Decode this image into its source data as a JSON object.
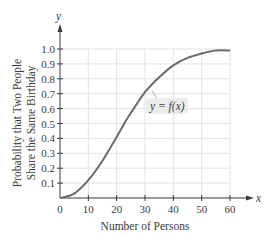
{
  "chart_data": {
    "type": "line",
    "title": "",
    "xlabel": "Number of Persons",
    "ylabel_line1": "Probability that Two People",
    "ylabel_line2": "Share the Same Birthday",
    "x_axis_symbol": "x",
    "y_axis_symbol": "y",
    "xlim": [
      0,
      60
    ],
    "ylim": [
      0,
      1.0
    ],
    "x_ticks": [
      "0",
      "10",
      "20",
      "30",
      "40",
      "50",
      "60"
    ],
    "y_ticks": [
      "0.1",
      "0.2",
      "0.3",
      "0.4",
      "0.5",
      "0.6",
      "0.7",
      "0.8",
      "0.9",
      "1.0"
    ],
    "grid": true,
    "annotation": "y = f(x)",
    "series": [
      {
        "name": "y = f(x)",
        "x": [
          0,
          5,
          10,
          15,
          20,
          23,
          25,
          30,
          35,
          40,
          45,
          50,
          55,
          60
        ],
        "values": [
          0.0,
          0.03,
          0.12,
          0.25,
          0.41,
          0.51,
          0.57,
          0.71,
          0.81,
          0.89,
          0.94,
          0.97,
          0.99,
          0.99
        ]
      }
    ],
    "colors": {
      "curve": "#6b6b6b",
      "grid": "#e2e2e2",
      "axis": "#3a3a3a",
      "label_box": "#ececec"
    }
  }
}
